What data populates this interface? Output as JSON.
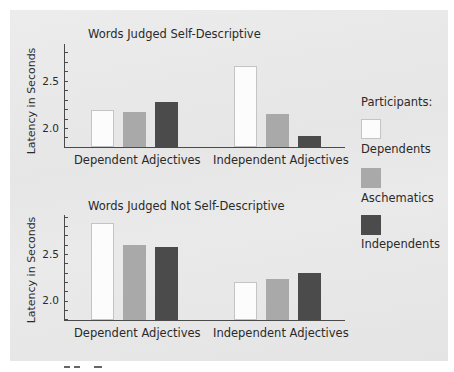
{
  "colors": {
    "dependents": "#fcfcfc",
    "dependents_border": "#c4c4c4",
    "aschematics": "#a9a9a9",
    "independents": "#4b4b4b",
    "background": "#e8e8e8",
    "axis": "#4a4a4a"
  },
  "legend": {
    "title": "Participants:",
    "items": [
      {
        "label": "Dependents",
        "color": "#fcfcfc"
      },
      {
        "label": "Aschematics",
        "color": "#a9a9a9"
      },
      {
        "label": "Independents",
        "color": "#4b4b4b"
      }
    ]
  },
  "chart_data": [
    {
      "type": "bar",
      "title": "Words Judged Self-Descriptive",
      "xlabel": "",
      "ylabel": "Latency in Seconds",
      "categories": [
        "Dependent Adjectives",
        "Independent Adjectives"
      ],
      "series": [
        {
          "name": "Dependents",
          "values": [
            2.19,
            2.66
          ]
        },
        {
          "name": "Aschematics",
          "values": [
            2.17,
            2.15
          ]
        },
        {
          "name": "Independents",
          "values": [
            2.27,
            1.92
          ]
        }
      ],
      "yticks": [
        "2.0",
        "2.5"
      ],
      "ylim": [
        1.8,
        2.9
      ],
      "grid": false,
      "legend_position": "right"
    },
    {
      "type": "bar",
      "title": "Words Judged Not Self-Descriptive",
      "xlabel": "",
      "ylabel": "Latency in Seconds",
      "categories": [
        "Dependent Adjectives",
        "Independent Adjectives"
      ],
      "series": [
        {
          "name": "Dependents",
          "values": [
            2.83,
            2.2
          ]
        },
        {
          "name": "Aschematics",
          "values": [
            2.6,
            2.23
          ]
        },
        {
          "name": "Independents",
          "values": [
            2.57,
            2.3
          ]
        }
      ],
      "yticks": [
        "2.0",
        "2.5"
      ],
      "ylim": [
        1.8,
        2.9
      ],
      "grid": false,
      "legend_position": "right"
    }
  ]
}
